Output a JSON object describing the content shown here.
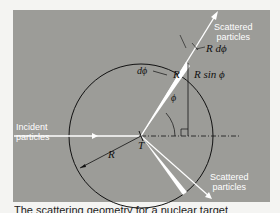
{
  "diagram": {
    "labels": {
      "incident": "Incident\nparticles",
      "incident_l1": "Incident",
      "incident_l2": "particles",
      "scattered_top_l1": "Scattered",
      "scattered_top_l2": "particles",
      "scattered_bottom_l1": "Scattered",
      "scattered_bottom_l2": "particles",
      "R_dphi": "R dϕ",
      "dphi": "dϕ",
      "R_ray": "R",
      "R_sin_phi": "R sin ϕ",
      "phi": "ϕ",
      "R_radius": "R",
      "T": "T"
    },
    "colors": {
      "panel": "#9c9c98",
      "lines": "#111111",
      "arrows": "#ffffff"
    }
  },
  "caption": {
    "text": "The scattering geometry for a nuclear target"
  }
}
